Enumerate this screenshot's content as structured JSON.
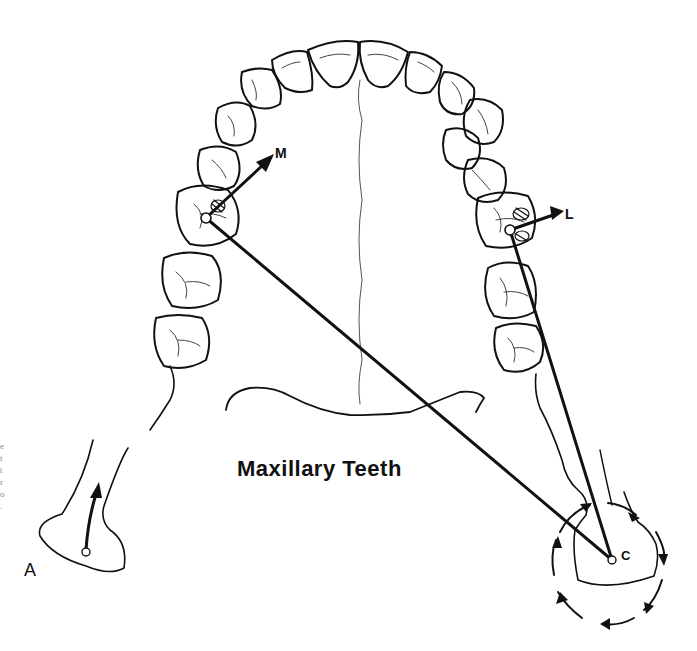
{
  "figure": {
    "title": "Maxillary Teeth",
    "labels": {
      "A": "A",
      "C": "C",
      "M": "M",
      "L": "L"
    },
    "edge_text_fragment": [
      "e",
      "t",
      "t",
      "r",
      "o",
      "."
    ],
    "colors": {
      "line": "#111111",
      "background": "#ffffff"
    }
  }
}
